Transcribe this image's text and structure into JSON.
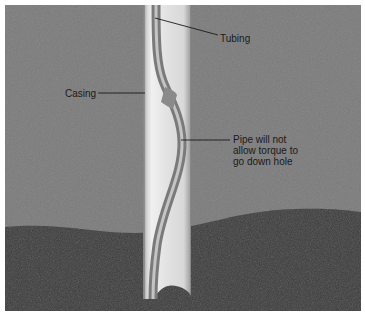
{
  "diagram": {
    "labels": {
      "tubing": "Tubing",
      "casing": "Casing",
      "pipe_note_line1": "Pipe will not",
      "pipe_note_line2": "allow torque to",
      "pipe_note_line3": "go down hole"
    },
    "colors": {
      "upper_rock": "#7d7d7d",
      "lower_rock": "#3a3a3a",
      "casing_light": "#e6e6e6",
      "casing_dark": "#a8a8a8",
      "tubing": "#8f8f8f",
      "leader_line": "#1a1a1a"
    }
  }
}
